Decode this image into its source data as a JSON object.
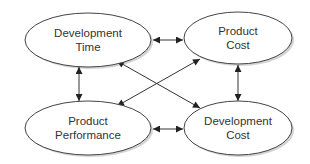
{
  "diagram": {
    "nodes": [
      {
        "id": "dev-time",
        "line1": "Development",
        "line2": "Time"
      },
      {
        "id": "prod-cost",
        "line1": "Product",
        "line2": "Cost"
      },
      {
        "id": "prod-perf",
        "line1": "Product",
        "line2": "Performance"
      },
      {
        "id": "dev-cost",
        "line1": "Development",
        "line2": "Cost"
      }
    ],
    "edges": [
      {
        "from": "dev-time",
        "to": "prod-cost",
        "type": "bidirectional"
      },
      {
        "from": "prod-perf",
        "to": "dev-cost",
        "type": "bidirectional"
      },
      {
        "from": "dev-time",
        "to": "prod-perf",
        "type": "bidirectional"
      },
      {
        "from": "prod-cost",
        "to": "dev-cost",
        "type": "bidirectional"
      },
      {
        "from": "dev-time",
        "to": "dev-cost",
        "type": "bidirectional"
      },
      {
        "from": "prod-perf",
        "to": "prod-cost",
        "type": "bidirectional"
      }
    ],
    "colors": {
      "stroke": "#333333",
      "fill": "#ffffff",
      "shadow": "#c8c8c8"
    }
  }
}
